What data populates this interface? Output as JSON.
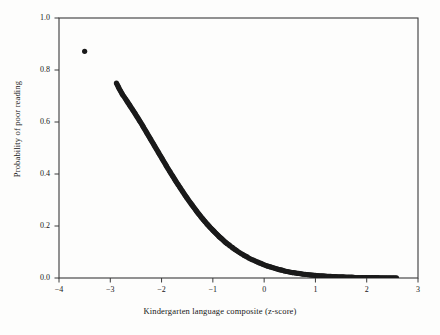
{
  "figure": {
    "background_color": "#fdfdfc",
    "frame_color": "#3a3a3a",
    "marker_color": "#1a1a1a"
  },
  "chart_data": {
    "type": "scatter",
    "title": "",
    "xlabel": "Kindergarten language composite (z-score)",
    "ylabel": "Probability of poor reading",
    "xlim": [
      -4,
      3
    ],
    "ylim": [
      0.0,
      1.0
    ],
    "xticks": [
      -4,
      -3,
      -2,
      -1,
      0,
      1,
      2,
      3
    ],
    "xtick_labels": [
      "−4",
      "−3",
      "−2",
      "−1",
      "0",
      "1",
      "2",
      "3"
    ],
    "yticks": [
      0.0,
      0.2,
      0.4,
      0.6,
      0.8,
      1.0
    ],
    "ytick_labels": [
      "0.0",
      "0.2",
      "0.4",
      "0.6",
      "0.8",
      "1.0"
    ],
    "grid": false,
    "legend": null,
    "marker": "filled-circle",
    "marker_size_px": 5.2,
    "series": [
      {
        "name": "Predicted probability of poor reading",
        "points": [
          [
            -3.5,
            0.872
          ],
          [
            -2.88,
            0.75
          ],
          [
            -2.83,
            0.73
          ],
          [
            -2.76,
            0.705
          ],
          [
            -2.74,
            0.7
          ],
          [
            -2.72,
            0.694
          ],
          [
            -2.7,
            0.688
          ],
          [
            -2.67,
            0.679
          ],
          [
            -2.64,
            0.67
          ],
          [
            -2.61,
            0.661
          ],
          [
            -2.58,
            0.652
          ],
          [
            -2.55,
            0.643
          ],
          [
            -2.52,
            0.634
          ],
          [
            -2.49,
            0.624
          ],
          [
            -2.46,
            0.615
          ],
          [
            -2.43,
            0.605
          ],
          [
            -2.4,
            0.596
          ],
          [
            -2.37,
            0.586
          ],
          [
            -2.34,
            0.576
          ],
          [
            -2.31,
            0.566
          ],
          [
            -2.28,
            0.556
          ],
          [
            -2.25,
            0.546
          ],
          [
            -2.22,
            0.536
          ],
          [
            -2.19,
            0.526
          ],
          [
            -2.16,
            0.516
          ],
          [
            -2.13,
            0.506
          ],
          [
            -2.1,
            0.496
          ],
          [
            -2.07,
            0.486
          ],
          [
            -2.04,
            0.476
          ],
          [
            -2.01,
            0.466
          ],
          [
            -1.98,
            0.456
          ],
          [
            -1.95,
            0.446
          ],
          [
            -1.92,
            0.436
          ],
          [
            -1.89,
            0.426
          ],
          [
            -1.86,
            0.416
          ],
          [
            -1.83,
            0.407
          ],
          [
            -1.8,
            0.397
          ],
          [
            -1.77,
            0.388
          ],
          [
            -1.74,
            0.378
          ],
          [
            -1.71,
            0.369
          ],
          [
            -1.68,
            0.36
          ],
          [
            -1.65,
            0.351
          ],
          [
            -1.62,
            0.342
          ],
          [
            -1.59,
            0.333
          ],
          [
            -1.56,
            0.324
          ],
          [
            -1.53,
            0.315
          ],
          [
            -1.5,
            0.307
          ],
          [
            -1.47,
            0.298
          ],
          [
            -1.44,
            0.29
          ],
          [
            -1.41,
            0.282
          ],
          [
            -1.38,
            0.274
          ],
          [
            -1.35,
            0.266
          ],
          [
            -1.32,
            0.258
          ],
          [
            -1.29,
            0.25
          ],
          [
            -1.26,
            0.243
          ],
          [
            -1.23,
            0.235
          ],
          [
            -1.2,
            0.228
          ],
          [
            -1.17,
            0.221
          ],
          [
            -1.14,
            0.214
          ],
          [
            -1.11,
            0.207
          ],
          [
            -1.08,
            0.201
          ],
          [
            -1.05,
            0.194
          ],
          [
            -1.02,
            0.188
          ],
          [
            -0.99,
            0.182
          ],
          [
            -0.96,
            0.176
          ],
          [
            -0.93,
            0.17
          ],
          [
            -0.9,
            0.164
          ],
          [
            -0.87,
            0.158
          ],
          [
            -0.84,
            0.153
          ],
          [
            -0.81,
            0.148
          ],
          [
            -0.78,
            0.142
          ],
          [
            -0.75,
            0.137
          ],
          [
            -0.72,
            0.132
          ],
          [
            -0.69,
            0.128
          ],
          [
            -0.66,
            0.123
          ],
          [
            -0.63,
            0.119
          ],
          [
            -0.6,
            0.114
          ],
          [
            -0.57,
            0.11
          ],
          [
            -0.54,
            0.106
          ],
          [
            -0.51,
            0.102
          ],
          [
            -0.48,
            0.098
          ],
          [
            -0.45,
            0.094
          ],
          [
            -0.42,
            0.091
          ],
          [
            -0.39,
            0.087
          ],
          [
            -0.36,
            0.084
          ],
          [
            -0.33,
            0.081
          ],
          [
            -0.3,
            0.077
          ],
          [
            -0.27,
            0.074
          ],
          [
            -0.24,
            0.071
          ],
          [
            -0.21,
            0.069
          ],
          [
            -0.18,
            0.066
          ],
          [
            -0.15,
            0.063
          ],
          [
            -0.12,
            0.061
          ],
          [
            -0.09,
            0.058
          ],
          [
            -0.06,
            0.056
          ],
          [
            -0.03,
            0.053
          ],
          [
            0.0,
            0.051
          ],
          [
            0.05,
            0.047
          ],
          [
            0.1,
            0.044
          ],
          [
            0.15,
            0.041
          ],
          [
            0.2,
            0.038
          ],
          [
            0.25,
            0.035
          ],
          [
            0.3,
            0.032
          ],
          [
            0.35,
            0.03
          ],
          [
            0.4,
            0.027
          ],
          [
            0.45,
            0.025
          ],
          [
            0.5,
            0.023
          ],
          [
            0.55,
            0.021
          ],
          [
            0.6,
            0.02
          ],
          [
            0.65,
            0.018
          ],
          [
            0.7,
            0.017
          ],
          [
            0.75,
            0.015
          ],
          [
            0.8,
            0.014
          ],
          [
            0.85,
            0.013
          ],
          [
            0.9,
            0.012
          ],
          [
            0.95,
            0.011
          ],
          [
            1.0,
            0.01
          ],
          [
            1.05,
            0.009
          ],
          [
            1.1,
            0.008
          ],
          [
            1.15,
            0.008
          ],
          [
            1.2,
            0.007
          ],
          [
            1.25,
            0.006
          ],
          [
            1.3,
            0.006
          ],
          [
            1.35,
            0.005
          ],
          [
            1.4,
            0.005
          ],
          [
            1.45,
            0.004
          ],
          [
            1.5,
            0.004
          ],
          [
            1.55,
            0.004
          ],
          [
            1.6,
            0.003
          ],
          [
            1.66,
            0.003
          ],
          [
            1.72,
            0.003
          ],
          [
            1.78,
            0.002
          ],
          [
            1.84,
            0.002
          ],
          [
            1.9,
            0.002
          ],
          [
            2.0,
            0.002
          ],
          [
            2.26,
            0.001
          ],
          [
            2.36,
            0.001
          ],
          [
            2.44,
            0.001
          ],
          [
            2.58,
            0.001
          ]
        ]
      }
    ]
  }
}
